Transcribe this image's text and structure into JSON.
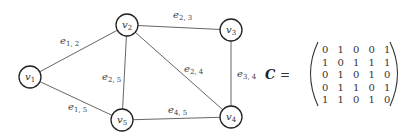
{
  "graph": {
    "nodes": [
      {
        "id": "v1",
        "base": "v",
        "sub": "1",
        "x": 30,
        "y": 77
      },
      {
        "id": "v2",
        "base": "v",
        "sub": "2",
        "x": 127,
        "y": 25
      },
      {
        "id": "v3",
        "base": "v",
        "sub": "3",
        "x": 231,
        "y": 30
      },
      {
        "id": "v4",
        "base": "v",
        "sub": "4",
        "x": 231,
        "y": 117
      },
      {
        "id": "v5",
        "base": "v",
        "sub": "5",
        "x": 122,
        "y": 120
      }
    ],
    "edges": [
      {
        "from": "v1",
        "to": "v2",
        "base": "e",
        "sub": "1, 2",
        "lx": 60,
        "ly": 44
      },
      {
        "from": "v1",
        "to": "v5",
        "base": "e",
        "sub": "1, 5",
        "lx": 68,
        "ly": 110
      },
      {
        "from": "v2",
        "to": "v3",
        "base": "e",
        "sub": "2, 3",
        "lx": 173,
        "ly": 18
      },
      {
        "from": "v2",
        "to": "v5",
        "base": "e",
        "sub": "2, 5",
        "lx": 102,
        "ly": 80
      },
      {
        "from": "v2",
        "to": "v4",
        "base": "e",
        "sub": "2, 4",
        "lx": 184,
        "ly": 72
      },
      {
        "from": "v3",
        "to": "v4",
        "base": "e",
        "sub": "3, 4",
        "lx": 237,
        "ly": 77
      },
      {
        "from": "v5",
        "to": "v4",
        "base": "e",
        "sub": "4, 5",
        "lx": 168,
        "ly": 113
      }
    ]
  },
  "matrix": {
    "name": "C",
    "equals": "=",
    "rows": [
      [
        "0",
        "1",
        "0",
        "0",
        "1"
      ],
      [
        "1",
        "0",
        "1",
        "1",
        "1"
      ],
      [
        "0",
        "1",
        "0",
        "1",
        "0"
      ],
      [
        "0",
        "1",
        "1",
        "0",
        "1"
      ],
      [
        "1",
        "1",
        "0",
        "1",
        "0"
      ]
    ]
  }
}
